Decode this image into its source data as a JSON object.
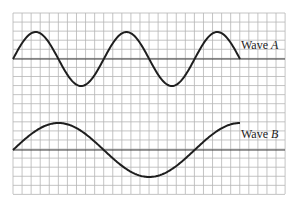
{
  "figure": {
    "grid": {
      "x0": 13,
      "y0": 13,
      "x1": 285,
      "y1": 194,
      "spacing": 9.07,
      "color": "#b5b5b5"
    },
    "curve_color": "#1e1e1e",
    "axis_color": "#3a3a3a",
    "waves": [
      {
        "name": "wave-a",
        "label_prefix": "Wave ",
        "label_var": "A",
        "axis_y": 59,
        "amplitude": 27,
        "period": 90.8,
        "x_start": 13,
        "x_end": 240,
        "label_x": 241,
        "label_y": 49
      },
      {
        "name": "wave-b",
        "label_prefix": "Wave ",
        "label_var": "B",
        "axis_y": 150,
        "amplitude": 27,
        "period": 181.6,
        "x_start": 13,
        "x_end": 240,
        "label_x": 241,
        "label_y": 138
      }
    ]
  }
}
